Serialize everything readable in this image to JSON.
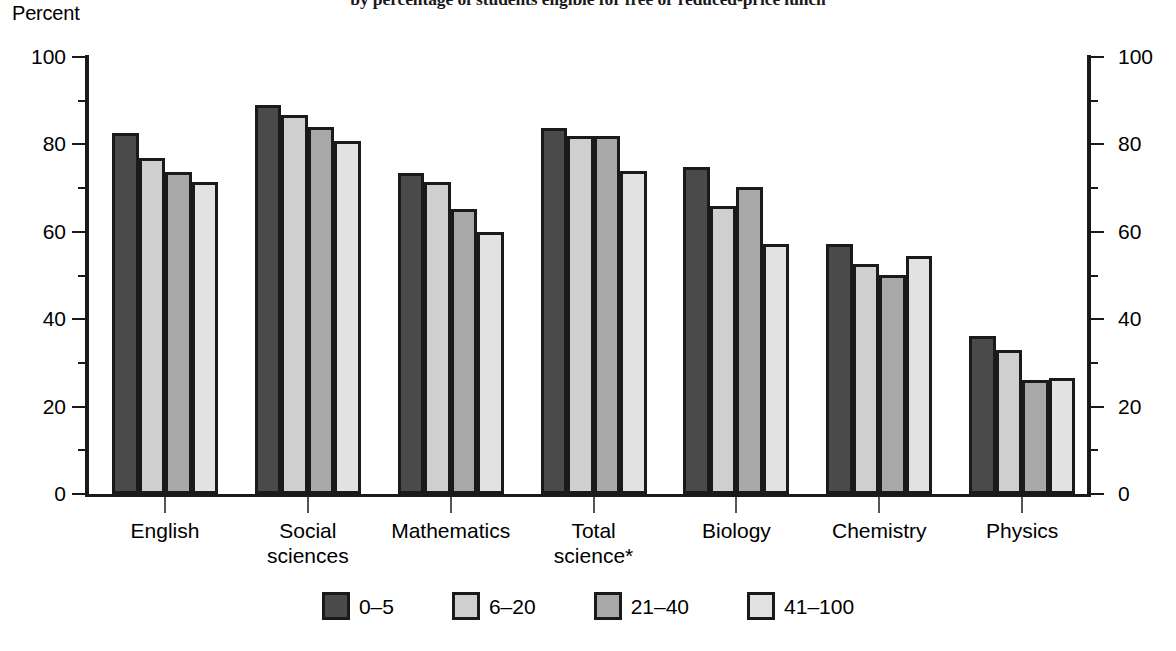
{
  "chart_data": {
    "type": "bar",
    "title": "by percentage of students eligible for free or reduced-price lunch",
    "subtitle": "",
    "xlabel": "",
    "ylabel": "Percent",
    "ylim": [
      0,
      100
    ],
    "ytick_step": 20,
    "yminor_step": 10,
    "grid": false,
    "legend_position": "bottom",
    "ytick_labels": [
      "0",
      "20",
      "40",
      "60",
      "80",
      "100"
    ],
    "ytick_labels_right": [
      "0",
      "20",
      "40",
      "60",
      "80",
      "100"
    ],
    "categories": [
      "English",
      "Social\nsciences",
      "Mathematics",
      "Total\nscience*",
      "Biology",
      "Chemistry",
      "Physics"
    ],
    "series": [
      {
        "name": "0–5",
        "color": "#4a4a4a",
        "values": [
          82.7,
          89.0,
          73.4,
          83.8,
          74.9,
          57.3,
          36.1
        ]
      },
      {
        "name": "6–20",
        "color": "#cfcfcf",
        "values": [
          76.8,
          86.8,
          71.5,
          82.0,
          66.0,
          52.6,
          33.0
        ]
      },
      {
        "name": "21–40",
        "color": "#a8a8a8",
        "values": [
          73.6,
          84.0,
          65.3,
          82.0,
          70.2,
          50.1,
          26.1
        ]
      },
      {
        "name": "41–100",
        "color": "#e2e2e2",
        "values": [
          71.3,
          80.7,
          60.0,
          73.9,
          57.1,
          54.5,
          26.6
        ]
      }
    ],
    "annotations": []
  },
  "axis": {
    "percent_label": "Percent"
  },
  "colors": {
    "axis": "#1a1a1a",
    "outline": "#1a1a1a",
    "background": "#ffffff"
  }
}
